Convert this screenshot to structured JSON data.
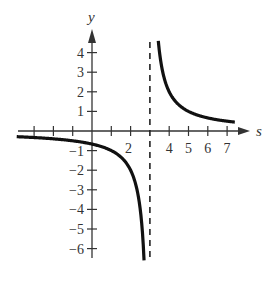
{
  "chart_data": {
    "type": "line",
    "title": "",
    "xlabel": "s",
    "ylabel": "y",
    "function": "y = 2/(s - 3)",
    "vertical_asymptote": 3,
    "horizontal_asymptote": 0,
    "xlim": [
      -3.5,
      7.5
    ],
    "ylim": [
      -6.5,
      4.8
    ],
    "grid": false,
    "legend": null,
    "x_ticks": [
      -3,
      -2,
      -1,
      1,
      2,
      3,
      4,
      5,
      6,
      7
    ],
    "x_tick_labels": [
      {
        "value": 2,
        "label": "2"
      },
      {
        "value": 4,
        "label": "4"
      },
      {
        "value": 5,
        "label": "5"
      },
      {
        "value": 6,
        "label": "6"
      },
      {
        "value": 7,
        "label": "7"
      }
    ],
    "y_ticks": [
      -6,
      -5,
      -4,
      -3,
      -2,
      -1,
      1,
      2,
      3,
      4
    ],
    "y_tick_labels": [
      {
        "value": 4,
        "label": "4"
      },
      {
        "value": 3,
        "label": "3"
      },
      {
        "value": 2,
        "label": "2"
      },
      {
        "value": 1,
        "label": "1"
      },
      {
        "value": -1,
        "label": "−1"
      },
      {
        "value": -2,
        "label": "−2"
      },
      {
        "value": -3,
        "label": "−3"
      },
      {
        "value": -4,
        "label": "−4"
      },
      {
        "value": -5,
        "label": "−5"
      },
      {
        "value": -6,
        "label": "−6"
      }
    ],
    "series": [
      {
        "name": "left branch",
        "x": [
          -3.5,
          -2,
          -1,
          0,
          1,
          2,
          2.5,
          2.7
        ],
        "y": [
          -0.31,
          -0.4,
          -0.5,
          -0.67,
          -1.0,
          -2.0,
          -4.0,
          -6.5
        ]
      },
      {
        "name": "right branch",
        "x": [
          3.44,
          3.5,
          4,
          5,
          6,
          7,
          7.3
        ],
        "y": [
          4.5,
          4.0,
          2.0,
          1.0,
          0.67,
          0.5,
          0.47
        ]
      }
    ]
  }
}
